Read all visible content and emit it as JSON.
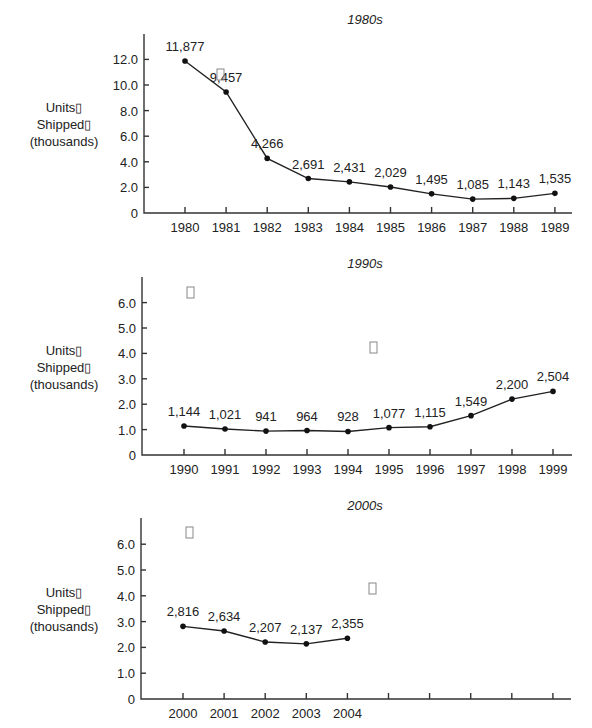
{
  "chart_data": [
    {
      "type": "line",
      "title": "1980s",
      "xlabel": "",
      "ylabel": "Units Shipped (thousands)",
      "ylabel_lines": [
        "Units▯",
        "Shipped▯",
        "(thousands)"
      ],
      "categories": [
        "1980",
        "1981",
        "1982",
        "1983",
        "1984",
        "1985",
        "1986",
        "1987",
        "1988",
        "1989"
      ],
      "values": [
        11.877,
        9.457,
        4.266,
        2.691,
        2.431,
        2.029,
        1.495,
        1.085,
        1.143,
        1.535
      ],
      "data_labels": [
        "11,877",
        "9,457",
        "4,266",
        "2,691",
        "2,431",
        "2,029",
        "1,495",
        "1,085",
        "1,143",
        "1,535"
      ],
      "yticks": [
        0,
        2,
        4,
        6,
        8,
        10,
        12
      ],
      "ytick_labels": [
        "0",
        "2.0",
        "4.0",
        "6.0",
        "8.0",
        "10.0",
        "12.0"
      ],
      "ylim": [
        0,
        13.9
      ],
      "grid": false,
      "legend": null,
      "stray_glyphs": [
        {
          "x": 220,
          "y": 82
        }
      ]
    },
    {
      "type": "line",
      "title": "1990s",
      "xlabel": "",
      "ylabel": "Units Shipped (thousands)",
      "ylabel_lines": [
        "Units▯",
        "Shipped▯",
        "(thousands)"
      ],
      "categories": [
        "1990",
        "1991",
        "1992",
        "1993",
        "1994",
        "1995",
        "1996",
        "1997",
        "1998",
        "1999"
      ],
      "values": [
        1.144,
        1.021,
        0.941,
        0.964,
        0.928,
        1.077,
        1.115,
        1.549,
        2.2,
        2.504
      ],
      "data_labels": [
        "1,144",
        "1,021",
        "941",
        "964",
        "928",
        "1,077",
        "1,115",
        "1,549",
        "2,200",
        "2,504"
      ],
      "yticks": [
        0,
        1,
        2,
        3,
        4,
        5,
        6
      ],
      "ytick_labels": [
        "0",
        "1.0",
        "2.0",
        "3.0",
        "4.0",
        "5.0",
        "6.0"
      ],
      "ylim": [
        0,
        7.0
      ],
      "grid": false,
      "legend": null,
      "stray_glyphs": [
        {
          "x": 190,
          "y": 300
        },
        {
          "x": 373,
          "y": 355
        }
      ]
    },
    {
      "type": "line",
      "title": "2000s",
      "xlabel": "",
      "ylabel": "Units Shipped (thousands)",
      "ylabel_lines": [
        "Units▯",
        "Shipped▯",
        "(thousands)"
      ],
      "categories": [
        "2000",
        "2001",
        "2002",
        "2003",
        "2004",
        "",
        "",
        "",
        "",
        ""
      ],
      "values": [
        2.816,
        2.634,
        2.207,
        2.137,
        2.355,
        null,
        null,
        null,
        null,
        null
      ],
      "data_labels": [
        "2,816",
        "2,634",
        "2,207",
        "2,137",
        "2,355",
        "",
        "",
        "",
        "",
        ""
      ],
      "yticks": [
        0,
        1,
        2,
        3,
        4,
        5,
        6
      ],
      "ytick_labels": [
        "0",
        "1.0",
        "2.0",
        "3.0",
        "4.0",
        "5.0",
        "6.0"
      ],
      "ylim": [
        0,
        7.0
      ],
      "grid": false,
      "legend": null,
      "stray_glyphs": [
        {
          "x": 189,
          "y": 540
        },
        {
          "x": 372,
          "y": 596
        }
      ]
    }
  ]
}
